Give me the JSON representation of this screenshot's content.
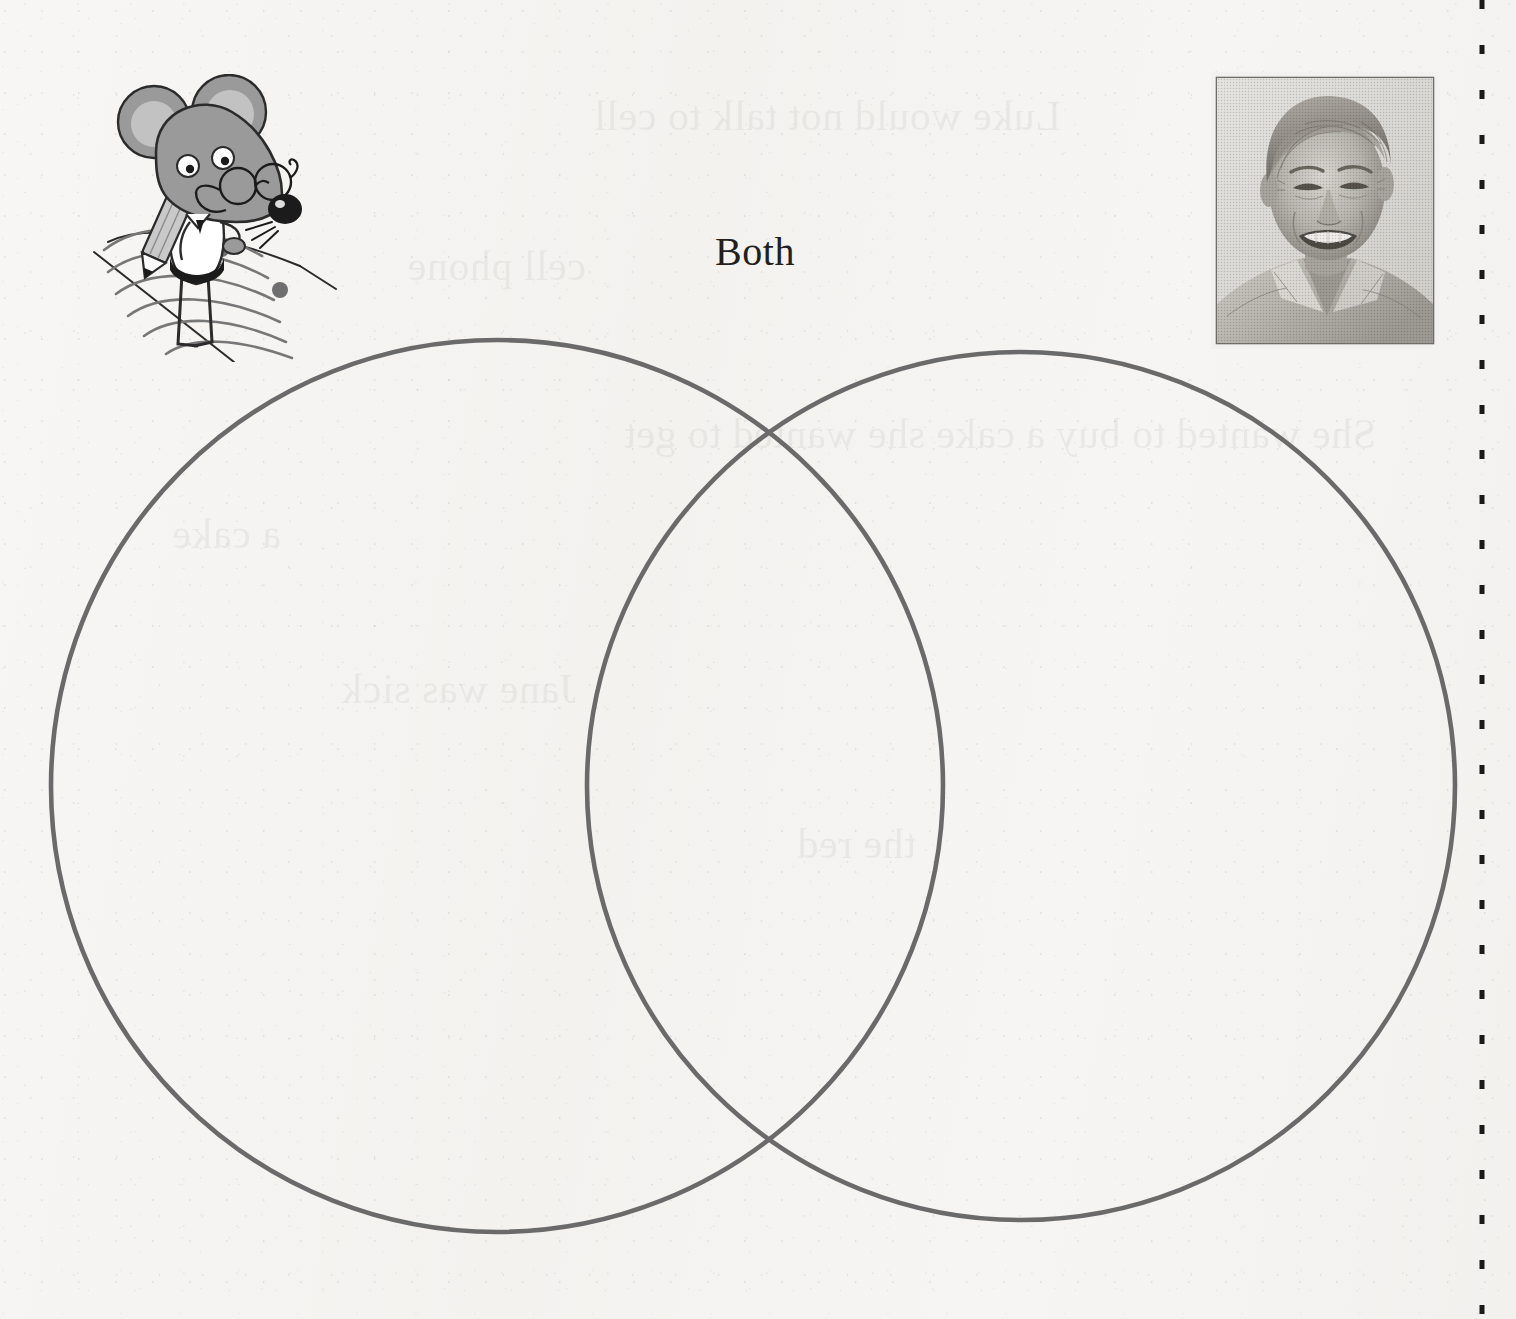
{
  "page": {
    "kind": "worksheet-page",
    "background_color": "#f5f4f2",
    "width": 1516,
    "height": 1319
  },
  "labels": {
    "both": "Both"
  },
  "venn": {
    "stroke_color": "#6b6b6b",
    "stroke_width": 4.5,
    "fill": "none",
    "left_circle": {
      "cx": 497,
      "cy": 786,
      "r": 446
    },
    "right_circle": {
      "cx": 1021,
      "cy": 786,
      "r": 434
    },
    "left_label": "",
    "right_label": ""
  },
  "illustration": {
    "name": "cartoon-mouse-writing",
    "description": "Gray cartoon mouse wearing round eyeglasses, holding a pencil and writing on a sheet of paper",
    "body_color": "#9a9a9a",
    "ear_inner_color": "#bfbfbf",
    "pencil_color": "#b8b8b8",
    "outline_color": "#2b2b2b"
  },
  "photo": {
    "name": "author-portrait",
    "description": "Black and white halftone photograph of a smiling middle-aged man with light hair wearing an open collared shirt",
    "border_color": "#5e5e5e",
    "tone_light": "#d8d6d2",
    "tone_mid": "#9b9893",
    "tone_dark": "#4b4945"
  },
  "cut_line": {
    "name": "dashed-cut-line",
    "orientation": "vertical",
    "color": "#1c1a18",
    "x": 1482
  },
  "showthrough": {
    "note": "Faint mirrored text bleeding through from the reverse side of the page",
    "lines": [
      {
        "text": "Luke would not talk to cell",
        "x": 455,
        "y": 92,
        "size": 42
      },
      {
        "text": "cell phone",
        "x": 930,
        "y": 242,
        "size": 42
      },
      {
        "text": "She wanted to buy a cake she wanted to get",
        "x": 140,
        "y": 410,
        "size": 42
      },
      {
        "text": "a cake",
        "x": 1235,
        "y": 510,
        "size": 42
      },
      {
        "text": "Jane was sick",
        "x": 940,
        "y": 665,
        "size": 42
      },
      {
        "text": "the red",
        "x": 600,
        "y": 820,
        "size": 42
      }
    ]
  }
}
